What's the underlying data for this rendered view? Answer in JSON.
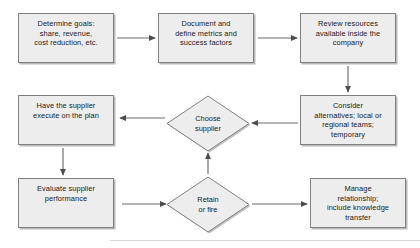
{
  "diagram": {
    "type": "flowchart",
    "style": {
      "node_fill": "#ededed",
      "node_border": "#808080",
      "arrow_color": "#4d4d4d",
      "text_color": "#1a1a1a",
      "background": "#ffffff"
    },
    "nodes": [
      {
        "id": "determine-goals",
        "shape": "rectangle",
        "label": "Determine goals:\nshare, revenue,\ncost reduction, etc.",
        "x": 18,
        "y": 13,
        "w": 96,
        "h": 50
      },
      {
        "id": "document-metrics",
        "shape": "rectangle",
        "label": "Document and\ndefine metrics and\nsuccess factors",
        "x": 158,
        "y": 13,
        "w": 96,
        "h": 50
      },
      {
        "id": "review-resources",
        "shape": "rectangle",
        "label": "Review resources\navailable inside the\ncompany",
        "x": 300,
        "y": 13,
        "w": 96,
        "h": 50
      },
      {
        "id": "consider-alternatives",
        "shape": "rectangle",
        "label": "Consider\nalternatives; local or\nregional teams;\ntemporary",
        "x": 300,
        "y": 95,
        "w": 96,
        "h": 50
      },
      {
        "id": "choose-supplier",
        "shape": "diamond",
        "label": "Choose\nsupplier",
        "x": 168,
        "y": 96,
        "w": 80,
        "h": 54
      },
      {
        "id": "have-supplier-execute",
        "shape": "rectangle",
        "label": "Have the supplier\nexecute on the plan",
        "x": 18,
        "y": 95,
        "w": 96,
        "h": 50
      },
      {
        "id": "evaluate-supplier",
        "shape": "rectangle",
        "label": "Evaluate supplier\nperformance",
        "x": 18,
        "y": 178,
        "w": 96,
        "h": 50
      },
      {
        "id": "retain-or-fire",
        "shape": "diamond",
        "label": "Retain\nor fire",
        "x": 168,
        "y": 177,
        "w": 80,
        "h": 54
      },
      {
        "id": "manage-relationship",
        "shape": "rectangle",
        "label": "Manage\nrelationship;\ninclude knowledge\ntransfer",
        "x": 310,
        "y": 178,
        "w": 96,
        "h": 50
      }
    ],
    "edges": [
      {
        "id": "edge-goals-to-document",
        "from": "determine-goals",
        "to": "document-metrics",
        "direction": "right"
      },
      {
        "id": "edge-document-to-review",
        "from": "document-metrics",
        "to": "review-resources",
        "direction": "right"
      },
      {
        "id": "edge-review-to-consider",
        "from": "review-resources",
        "to": "consider-alternatives",
        "direction": "down"
      },
      {
        "id": "edge-consider-to-choose",
        "from": "consider-alternatives",
        "to": "choose-supplier",
        "direction": "left"
      },
      {
        "id": "edge-choose-to-have",
        "from": "choose-supplier",
        "to": "have-supplier-execute",
        "direction": "left"
      },
      {
        "id": "edge-have-to-evaluate",
        "from": "have-supplier-execute",
        "to": "evaluate-supplier",
        "direction": "down"
      },
      {
        "id": "edge-evaluate-to-retain",
        "from": "evaluate-supplier",
        "to": "retain-or-fire",
        "direction": "right"
      },
      {
        "id": "edge-retain-to-choose",
        "from": "retain-or-fire",
        "to": "choose-supplier",
        "direction": "up"
      },
      {
        "id": "edge-retain-to-manage",
        "from": "retain-or-fire",
        "to": "manage-relationship",
        "direction": "right"
      }
    ]
  }
}
